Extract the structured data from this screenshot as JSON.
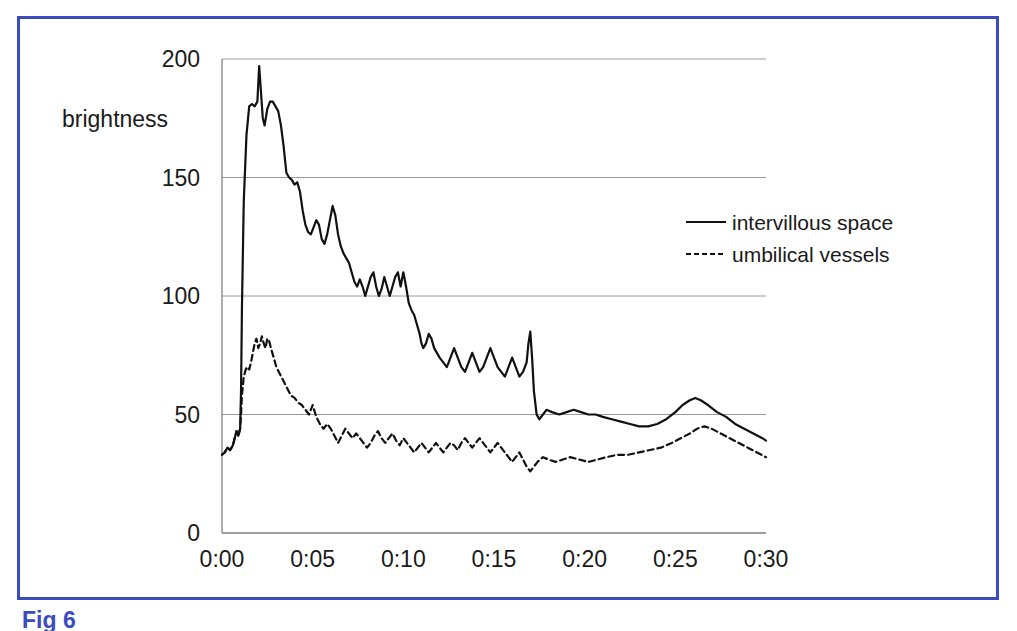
{
  "figure": {
    "caption": "Fig 6",
    "caption_color": "#3b4cc0",
    "frame_color": "#3b4cc0"
  },
  "chart_data": {
    "type": "line",
    "title": "",
    "xlabel": "",
    "ylabel": "brightness",
    "ylim": [
      0,
      200
    ],
    "xlim": [
      0,
      30
    ],
    "yticks": [
      0,
      50,
      100,
      150,
      200
    ],
    "ytick_labels": [
      "0",
      "50",
      "100",
      "150",
      "200"
    ],
    "xticks": [
      0,
      5,
      10,
      15,
      20,
      25,
      30
    ],
    "xtick_labels": [
      "0:00",
      "0:05",
      "0:10",
      "0:15",
      "0:20",
      "0:25",
      "0:30"
    ],
    "grid": "horizontal",
    "legend_position": "upper-right-inside",
    "line_color": "#111111",
    "grid_color": "#9a9a9a",
    "series": [
      {
        "name": "intervillous space",
        "style": "solid",
        "x": [
          0.0,
          0.15,
          0.3,
          0.45,
          0.6,
          0.7,
          0.8,
          0.9,
          1.0,
          1.05,
          1.1,
          1.2,
          1.35,
          1.5,
          1.65,
          1.8,
          1.95,
          2.05,
          2.15,
          2.25,
          2.35,
          2.5,
          2.65,
          2.8,
          2.95,
          3.1,
          3.25,
          3.4,
          3.55,
          3.7,
          3.85,
          4.0,
          4.15,
          4.3,
          4.45,
          4.6,
          4.75,
          4.9,
          5.05,
          5.2,
          5.35,
          5.5,
          5.65,
          5.8,
          5.95,
          6.1,
          6.25,
          6.4,
          6.55,
          6.7,
          6.85,
          7.0,
          7.15,
          7.3,
          7.45,
          7.6,
          7.75,
          7.9,
          8.05,
          8.2,
          8.35,
          8.5,
          8.65,
          8.8,
          8.95,
          9.1,
          9.25,
          9.4,
          9.55,
          9.7,
          9.85,
          10.0,
          10.15,
          10.3,
          10.45,
          10.6,
          10.75,
          10.9,
          11.0,
          11.1,
          11.25,
          11.4,
          11.55,
          11.7,
          11.85,
          12.0,
          12.2,
          12.4,
          12.6,
          12.8,
          13.0,
          13.2,
          13.4,
          13.6,
          13.8,
          14.0,
          14.2,
          14.4,
          14.6,
          14.8,
          15.0,
          15.2,
          15.4,
          15.6,
          15.8,
          16.0,
          16.2,
          16.4,
          16.6,
          16.8,
          16.9,
          17.0,
          17.1,
          17.2,
          17.35,
          17.5,
          17.7,
          17.9,
          18.2,
          18.6,
          19.0,
          19.4,
          19.8,
          20.2,
          20.6,
          21.0,
          21.5,
          22.0,
          22.5,
          23.0,
          23.5,
          24.0,
          24.5,
          25.0,
          25.4,
          25.8,
          26.1,
          26.4,
          26.8,
          27.3,
          27.8,
          28.3,
          28.8,
          29.3,
          29.8,
          30.0
        ],
        "y": [
          33,
          34,
          36,
          35,
          37,
          40,
          43,
          41,
          44,
          60,
          95,
          140,
          168,
          180,
          181,
          180,
          182,
          197,
          186,
          175,
          172,
          179,
          182,
          182,
          180,
          178,
          172,
          163,
          152,
          150,
          149,
          147,
          148,
          144,
          136,
          130,
          127,
          126,
          129,
          132,
          130,
          124,
          122,
          126,
          132,
          138,
          134,
          126,
          121,
          118,
          116,
          114,
          110,
          106,
          104,
          107,
          104,
          100,
          104,
          108,
          110,
          104,
          100,
          103,
          108,
          104,
          100,
          104,
          108,
          110,
          104,
          110,
          104,
          97,
          94,
          92,
          88,
          84,
          80,
          78,
          80,
          84,
          82,
          78,
          76,
          74,
          72,
          70,
          74,
          78,
          74,
          70,
          68,
          72,
          76,
          72,
          68,
          70,
          74,
          78,
          74,
          70,
          68,
          66,
          70,
          74,
          70,
          66,
          68,
          72,
          80,
          85,
          74,
          60,
          50,
          48,
          50,
          52,
          51,
          50,
          51,
          52,
          51,
          50,
          50,
          49,
          48,
          47,
          46,
          45,
          45,
          46,
          48,
          51,
          54,
          56,
          57,
          56,
          54,
          51,
          49,
          46,
          44,
          42,
          40,
          39
        ]
      },
      {
        "name": "umbilical vessels",
        "style": "dashed",
        "x": [
          0.0,
          0.15,
          0.3,
          0.45,
          0.6,
          0.7,
          0.8,
          0.9,
          1.0,
          1.05,
          1.1,
          1.2,
          1.35,
          1.5,
          1.6,
          1.7,
          1.8,
          1.9,
          2.0,
          2.1,
          2.2,
          2.3,
          2.4,
          2.5,
          2.6,
          2.7,
          2.85,
          3.0,
          3.2,
          3.4,
          3.6,
          3.8,
          4.0,
          4.2,
          4.4,
          4.6,
          4.8,
          5.0,
          5.2,
          5.4,
          5.6,
          5.8,
          6.0,
          6.2,
          6.4,
          6.6,
          6.8,
          7.0,
          7.2,
          7.4,
          7.6,
          7.8,
          8.0,
          8.2,
          8.4,
          8.6,
          8.8,
          9.0,
          9.2,
          9.4,
          9.6,
          9.8,
          10.0,
          10.2,
          10.4,
          10.6,
          10.8,
          11.0,
          11.2,
          11.4,
          11.6,
          11.8,
          12.0,
          12.2,
          12.4,
          12.6,
          12.8,
          13.0,
          13.2,
          13.4,
          13.6,
          13.8,
          14.0,
          14.2,
          14.4,
          14.6,
          14.8,
          15.0,
          15.2,
          15.4,
          15.6,
          15.8,
          16.0,
          16.2,
          16.4,
          16.6,
          16.8,
          17.0,
          17.2,
          17.4,
          17.7,
          18.0,
          18.4,
          18.8,
          19.2,
          19.7,
          20.2,
          20.7,
          21.2,
          21.8,
          22.4,
          23.0,
          23.6,
          24.2,
          24.8,
          25.3,
          25.8,
          26.2,
          26.6,
          27.0,
          27.5,
          28.0,
          28.5,
          29.0,
          29.5,
          30.0
        ],
        "y": [
          33,
          34,
          36,
          35,
          37,
          40,
          43,
          41,
          44,
          50,
          58,
          66,
          70,
          69,
          72,
          76,
          80,
          82,
          78,
          80,
          83,
          80,
          78,
          82,
          81,
          78,
          74,
          70,
          67,
          64,
          61,
          58,
          57,
          55,
          54,
          52,
          50,
          54,
          49,
          46,
          44,
          46,
          44,
          41,
          38,
          41,
          44,
          42,
          40,
          42,
          40,
          38,
          36,
          38,
          41,
          43,
          40,
          38,
          40,
          42,
          39,
          37,
          40,
          38,
          36,
          34,
          36,
          38,
          36,
          34,
          36,
          38,
          36,
          34,
          36,
          38,
          37,
          35,
          38,
          40,
          38,
          36,
          38,
          40,
          38,
          36,
          34,
          36,
          38,
          36,
          34,
          32,
          30,
          32,
          34,
          31,
          28,
          26,
          28,
          30,
          32,
          31,
          30,
          31,
          32,
          31,
          30,
          31,
          32,
          33,
          33,
          34,
          35,
          36,
          38,
          40,
          42,
          44,
          45,
          44,
          42,
          40,
          38,
          36,
          34,
          32
        ]
      }
    ]
  },
  "legend": {
    "items": [
      {
        "label": "intervillous space",
        "style": "solid"
      },
      {
        "label": "umbilical vessels",
        "style": "dashed"
      }
    ]
  }
}
